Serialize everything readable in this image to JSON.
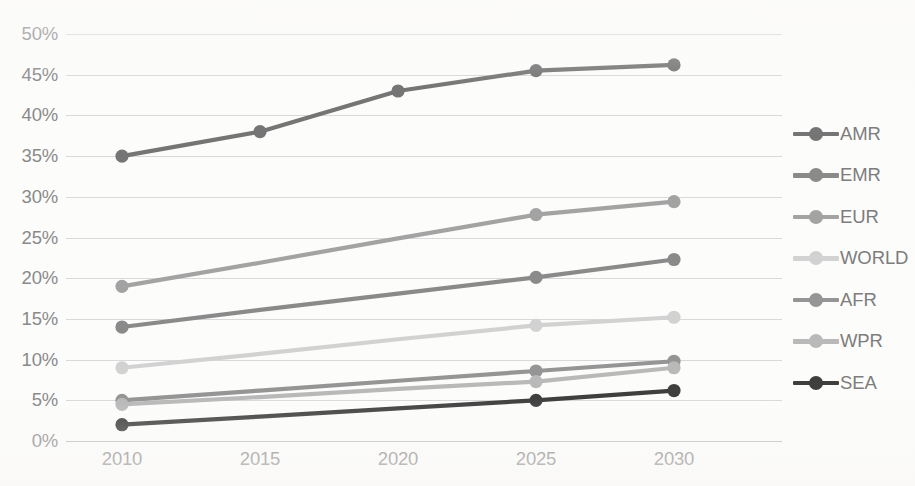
{
  "chart_data": {
    "type": "line",
    "title": "",
    "subtitle": "",
    "xlabel": "",
    "ylabel": "",
    "categories": [
      "2010",
      "2015",
      "2020",
      "2025",
      "2030"
    ],
    "x_tick_labels": [
      "2010",
      "2015",
      "2020",
      "2025",
      "2030"
    ],
    "y_tick_labels": [
      "0%",
      "5%",
      "10%",
      "15%",
      "20%",
      "25%",
      "30%",
      "35%",
      "40%",
      "45%",
      "50%"
    ],
    "y_tick_values": [
      0,
      5,
      10,
      15,
      20,
      25,
      30,
      35,
      40,
      45,
      50
    ],
    "ylim": [
      0,
      50
    ],
    "y_unit": "%",
    "grid": "horizontal",
    "legend_position": "right",
    "series": [
      {
        "name": "AMR",
        "color": "#757575",
        "markers": [
          true,
          true,
          true,
          true,
          true
        ],
        "values": [
          35.0,
          38.0,
          43.0,
          45.5,
          46.2
        ]
      },
      {
        "name": "EMR",
        "color": "#8a8a8a",
        "markers": [
          true,
          false,
          false,
          true,
          true
        ],
        "values": [
          14.0,
          16.1,
          18.1,
          20.1,
          22.3
        ]
      },
      {
        "name": "EUR",
        "color": "#a3a3a3",
        "markers": [
          true,
          false,
          false,
          true,
          true
        ],
        "values": [
          19.0,
          21.9,
          24.9,
          27.8,
          29.4
        ]
      },
      {
        "name": "WORLD",
        "color": "#d2d2d2",
        "markers": [
          true,
          false,
          false,
          true,
          true
        ],
        "values": [
          9.0,
          10.7,
          12.5,
          14.2,
          15.2
        ]
      },
      {
        "name": "AFR",
        "color": "#959595",
        "markers": [
          true,
          false,
          false,
          true,
          true
        ],
        "values": [
          5.0,
          6.2,
          7.4,
          8.6,
          9.8
        ]
      },
      {
        "name": "WPR",
        "color": "#b9b9b9",
        "markers": [
          true,
          false,
          false,
          true,
          true
        ],
        "values": [
          4.5,
          5.4,
          6.4,
          7.3,
          9.0
        ]
      },
      {
        "name": "SEA",
        "color": "#3f3f3f",
        "markers": [
          true,
          false,
          false,
          true,
          true
        ],
        "values": [
          2.0,
          3.0,
          4.0,
          5.0,
          6.2
        ]
      }
    ]
  },
  "legend": {
    "items": [
      {
        "label": "AMR"
      },
      {
        "label": "EMR"
      },
      {
        "label": "EUR"
      },
      {
        "label": "WORLD"
      },
      {
        "label": "AFR"
      },
      {
        "label": "WPR"
      },
      {
        "label": "SEA"
      }
    ]
  },
  "colors": {
    "background": "#fcfcfb",
    "gridline": "#d9d9d9",
    "axis": "#bfbfbf",
    "tick_text": "#8a8a8a",
    "legend_text": "#7d7d7d"
  }
}
